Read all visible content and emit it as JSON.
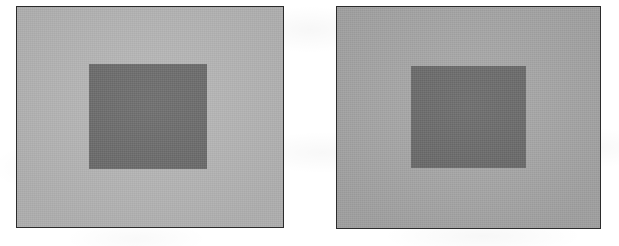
{
  "figure": {
    "kind": "simultaneous-lightness-contrast-demo",
    "background_color": "#ffffff",
    "border_color": "#2b2b2b",
    "panel_count": 2
  },
  "panels": [
    {
      "id": "left",
      "name": "left-panel",
      "surround_color": "#b5b5b5",
      "target_color": "#6b6b6b",
      "label": ""
    },
    {
      "id": "right",
      "name": "right-panel",
      "surround_color": "#a6a6a6",
      "target_color": "#6a6a6a",
      "label": ""
    }
  ],
  "chart_data": {
    "type": "heatmap",
    "title": "",
    "xlabel": "",
    "ylabel": "",
    "categories": [
      "left panel",
      "right panel"
    ],
    "series": [
      {
        "name": "surround luminance (0-255)",
        "values": [
          181,
          166
        ]
      },
      {
        "name": "center square luminance (0-255)",
        "values": [
          107,
          106
        ]
      }
    ],
    "annotations": []
  }
}
